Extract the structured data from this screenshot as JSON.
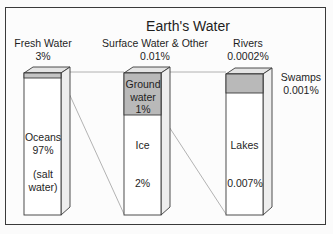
{
  "title": "Earth's Water",
  "columns": [
    {
      "header": "Fresh Water",
      "header_value": "3%",
      "segments": [
        {
          "label": "Fresh Water",
          "value": "3%",
          "color": "#c8c8c8"
        },
        {
          "label": "Oceans",
          "value": "97%",
          "note": "(salt water)",
          "color": "#ffffff"
        }
      ]
    },
    {
      "header": "Surface Water & Other",
      "header_value": "0.01%",
      "segments": [
        {
          "label": "Ground water",
          "value": "1%",
          "color": "#b9b9b9"
        },
        {
          "label": "Ice",
          "value": "2%",
          "color": "#ffffff"
        }
      ]
    },
    {
      "header": "Rivers",
      "header_value": "0.0002%",
      "segments": [
        {
          "label": "Swamps",
          "value": "0.001%",
          "color": "#b9b9b9"
        },
        {
          "label": "Lakes",
          "value": "0.007%",
          "color": "#ffffff"
        }
      ]
    }
  ],
  "text": {
    "fresh_header": "Fresh Water",
    "fresh_value": "3%",
    "surface_header": "Surface Water & Other",
    "surface_value": "0.01%",
    "rivers_header": "Rivers",
    "rivers_value": "0.0002%",
    "swamps_label": "Swamps",
    "swamps_value": "0.001%",
    "oceans_label": "Oceans",
    "oceans_value": "97%",
    "oceans_note_1": "(salt",
    "oceans_note_2": "water)",
    "ground_1": "Ground",
    "ground_2": "water",
    "ground_value": "1%",
    "ice_label": "Ice",
    "ice_value": "2%",
    "lakes_label": "Lakes",
    "lakes_value": "0.007%"
  },
  "colors": {
    "frame": "#3a3a3a",
    "bar_fill": "#ffffff",
    "band_fill": "#bdbdbd",
    "side_fill": "#eeeeee",
    "top_fill": "#e4e4e4",
    "connector": "#9a9a9a"
  }
}
